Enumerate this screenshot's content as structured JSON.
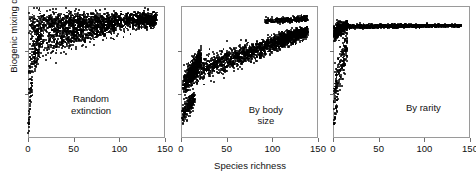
{
  "figure": {
    "background": "#ffffff",
    "ink_color": "#000000",
    "frame_color": "#9a9a9a"
  },
  "axes": {
    "y_title": "Biogenic mixing depth (cm)",
    "x_title": "Species richness",
    "x_ticklabels": [
      "0",
      "50",
      "100",
      "150"
    ],
    "x_tickvalues": [
      0,
      50,
      100,
      150
    ],
    "y_ticklabels": [],
    "y_tick_fractions": [
      0.33,
      0.66
    ]
  },
  "chart_data": {
    "type": "scatter",
    "title": "",
    "xlabel": "Species richness",
    "ylabel": "Biogenic mixing depth (cm)",
    "xlim": [
      0,
      150
    ],
    "ylim": [
      0,
      1
    ],
    "grid": false,
    "legend": null,
    "y_axis_numeric_labels": false,
    "panels": [
      {
        "id": "random-extinction",
        "label": "Random\nextinction",
        "label_x_frac": 0.46,
        "label_y_frac": 0.66,
        "description": "Dense wedge of points fanning out from low species richness toward a saturated upper band; sparse isolated points descend along x near 0.",
        "clusters": [
          {
            "name": "main-wedge-upper",
            "n": 1500,
            "x_min": 1,
            "x_max": 140,
            "y_center_start": 0.86,
            "y_center_end": 0.9,
            "y_spread_start": 0.1,
            "y_spread_end": 0.055,
            "seed": 11
          },
          {
            "name": "wedge-lower-tail",
            "n": 620,
            "x_min": 1,
            "x_max": 95,
            "y_center_start": 0.7,
            "y_center_end": 0.84,
            "y_spread_start": 0.14,
            "y_spread_end": 0.05,
            "seed": 23
          },
          {
            "name": "low-richness-scatter",
            "n": 130,
            "x_min": 0.5,
            "x_max": 14,
            "y_center_start": 0.48,
            "y_center_end": 0.76,
            "y_spread_start": 0.22,
            "y_spread_end": 0.14,
            "seed": 37
          },
          {
            "name": "near-zero-vertical-tail",
            "n": 46,
            "x_min": 0.3,
            "x_max": 5,
            "y_center_start": 0.07,
            "y_center_end": 0.5,
            "y_spread_start": 0.04,
            "y_spread_end": 0.1,
            "seed": 53
          },
          {
            "name": "right-edge-band",
            "n": 210,
            "x_min": 120,
            "x_max": 141,
            "y_center_start": 0.89,
            "y_center_end": 0.9,
            "y_spread_start": 0.05,
            "y_spread_end": 0.04,
            "seed": 67
          }
        ]
      },
      {
        "id": "by-body-size",
        "label": "By body size",
        "label_x_frac": 0.62,
        "label_y_frac": 0.74,
        "description": "Ascending diagonal band rising from lower-left to upper-right, a detached lower-left blob, and a separate short upper band at high richness.",
        "clusters": [
          {
            "name": "main-ascending-band",
            "n": 1700,
            "x_min": 3,
            "x_max": 138,
            "y_center_start": 0.47,
            "y_center_end": 0.8,
            "y_spread_start": 0.1,
            "y_spread_end": 0.045,
            "seed": 101
          },
          {
            "name": "steep-left-riser",
            "n": 520,
            "x_min": 2,
            "x_max": 22,
            "y_center_start": 0.38,
            "y_center_end": 0.62,
            "y_spread_start": 0.09,
            "y_spread_end": 0.07,
            "seed": 113
          },
          {
            "name": "detached-lower-blob",
            "n": 230,
            "x_min": 1,
            "x_max": 15,
            "y_center_start": 0.16,
            "y_center_end": 0.31,
            "y_spread_start": 0.07,
            "y_spread_end": 0.06,
            "seed": 127
          },
          {
            "name": "upper-separate-band",
            "n": 300,
            "x_min": 92,
            "x_max": 139,
            "y_center_start": 0.885,
            "y_center_end": 0.905,
            "y_spread_start": 0.022,
            "y_spread_end": 0.02,
            "seed": 139
          },
          {
            "name": "band-right-thickening",
            "n": 260,
            "x_min": 108,
            "x_max": 139,
            "y_center_start": 0.76,
            "y_center_end": 0.815,
            "y_spread_start": 0.045,
            "y_spread_end": 0.035,
            "seed": 151
          }
        ]
      },
      {
        "id": "by-rarity",
        "label": "By rarity",
        "label_x_frac": 0.66,
        "label_y_frac": 0.73,
        "description": "Points collapse onto a thin flat asymptotic line running to high richness, with a vertical spray of scattered points near zero richness.",
        "clusters": [
          {
            "name": "flat-asymptote-line",
            "n": 1500,
            "x_min": 12,
            "x_max": 140,
            "y_center_start": 0.845,
            "y_center_end": 0.852,
            "y_spread_start": 0.016,
            "y_spread_end": 0.008,
            "seed": 201
          },
          {
            "name": "left-knee-dense",
            "n": 520,
            "x_min": 1,
            "x_max": 16,
            "y_center_start": 0.8,
            "y_center_end": 0.855,
            "y_spread_start": 0.07,
            "y_spread_end": 0.025,
            "seed": 211
          },
          {
            "name": "near-zero-scatter",
            "n": 190,
            "x_min": 0.5,
            "x_max": 16,
            "y_center_start": 0.34,
            "y_center_end": 0.72,
            "y_spread_start": 0.16,
            "y_spread_end": 0.12,
            "seed": 223
          },
          {
            "name": "low-tail-points",
            "n": 34,
            "x_min": 0.5,
            "x_max": 6,
            "y_center_start": 0.07,
            "y_center_end": 0.34,
            "y_spread_start": 0.04,
            "y_spread_end": 0.07,
            "seed": 233
          }
        ]
      }
    ]
  },
  "layout": {
    "panel_left_positions": [
      28,
      181,
      333
    ],
    "panel_width": 137,
    "panel_top": 6,
    "panel_height": 132
  }
}
